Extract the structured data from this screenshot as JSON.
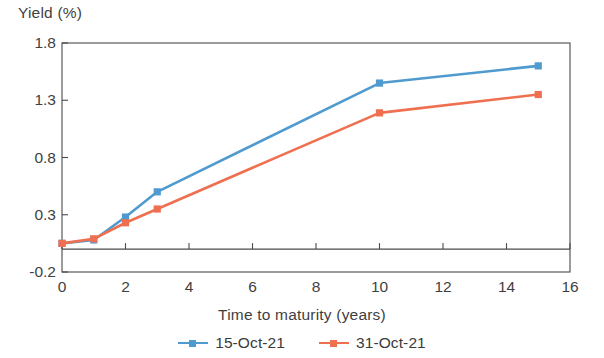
{
  "chart_data": {
    "type": "line",
    "title": "",
    "ylabel": "Yield (%)",
    "xlabel": "Time to maturity (years)",
    "xlim": [
      0,
      16
    ],
    "ylim": [
      -0.2,
      1.8
    ],
    "ytick_labels": [
      "1.8",
      "1.3",
      "0.8",
      "0.3",
      "-0.2"
    ],
    "ytick_values": [
      1.8,
      1.3,
      0.8,
      0.3,
      -0.2
    ],
    "xtick_labels": [
      "0",
      "2",
      "4",
      "6",
      "8",
      "10",
      "12",
      "14",
      "16"
    ],
    "xtick_values": [
      0,
      2,
      4,
      6,
      8,
      10,
      12,
      14,
      16
    ],
    "grid": false,
    "legend_position": "bottom",
    "x": [
      0,
      1,
      2,
      3,
      10,
      15
    ],
    "series": [
      {
        "name": "15-Oct-21",
        "color": "#4f9bd0",
        "values": [
          0.05,
          0.08,
          0.28,
          0.5,
          1.45,
          1.6
        ]
      },
      {
        "name": "31-Oct-21",
        "color": "#ee7050",
        "values": [
          0.05,
          0.09,
          0.23,
          0.35,
          1.19,
          1.35
        ]
      }
    ],
    "zero_line": 0
  }
}
